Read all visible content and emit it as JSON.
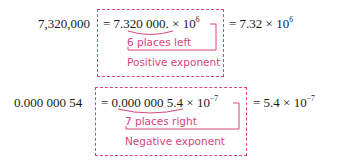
{
  "examples": [
    {
      "original": "7,320,000",
      "expanded_mantissa": "7.320 000.",
      "expanded_prefix": "= ",
      "times": " × 10",
      "expanded_exponent": "6",
      "move_label": "6 places left",
      "sign_label": "Positive exponent",
      "result_prefix": "= 7.32 × 10",
      "result_exponent": "6"
    },
    {
      "original": "0.000 000 54",
      "expanded_mantissa": "0.000 000 5.4",
      "expanded_prefix": "= ",
      "times": " × 10",
      "expanded_exponent": "−7",
      "move_label": "7 places right",
      "sign_label": "Negative exponent",
      "result_prefix": "= 5.4 × 10",
      "result_exponent": "−7"
    }
  ],
  "colors": {
    "accent": "#d6457e",
    "text": "#1a1a1a"
  }
}
